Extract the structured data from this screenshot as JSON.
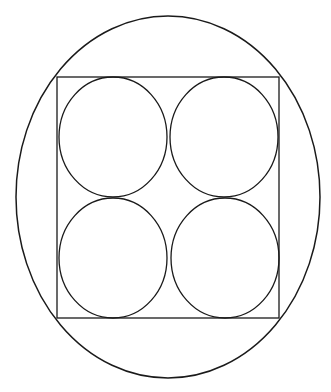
{
  "diagram": {
    "stroke_color": "#1a1a1a",
    "background": "#ffffff",
    "ellipse": {
      "cx": 168,
      "cy": 197,
      "rx": 152,
      "ry": 181
    },
    "square": {
      "x": 57,
      "y": 77,
      "width": 222,
      "height": 241
    },
    "circles": [
      {
        "name": "top-left",
        "cx": 113,
        "cy": 137,
        "rx": 54,
        "ry": 60
      },
      {
        "name": "top-right",
        "cx": 224,
        "cy": 137,
        "rx": 54,
        "ry": 60
      },
      {
        "name": "bottom-left",
        "cx": 113,
        "cy": 258,
        "rx": 54,
        "ry": 60
      },
      {
        "name": "bottom-right",
        "cx": 225,
        "cy": 258,
        "rx": 54,
        "ry": 60
      }
    ]
  }
}
